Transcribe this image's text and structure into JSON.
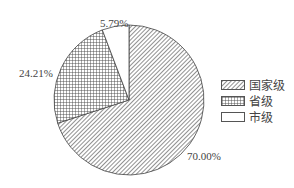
{
  "chart_data": {
    "type": "pie",
    "title": "",
    "categories": [
      "国家级",
      "省级",
      "市级"
    ],
    "values": [
      70.0,
      24.21,
      5.79
    ],
    "labels": [
      "70.00%",
      "24.21%",
      "5.79%"
    ],
    "patterns": [
      "diagonal-hatch",
      "cross-hatch",
      "blank"
    ],
    "legend_position": "right",
    "start_angle": "12 o'clock",
    "direction": "clockwise for 国家级, then 省级, 市级 ending at top"
  },
  "legend": {
    "items": [
      {
        "label": "国家级",
        "pattern": "diagonal-hatch"
      },
      {
        "label": "省级",
        "pattern": "cross-hatch"
      },
      {
        "label": "市级",
        "pattern": "blank"
      }
    ]
  },
  "data_labels": {
    "national": "70.00%",
    "provincial": "24.21%",
    "city": "5.79%"
  }
}
